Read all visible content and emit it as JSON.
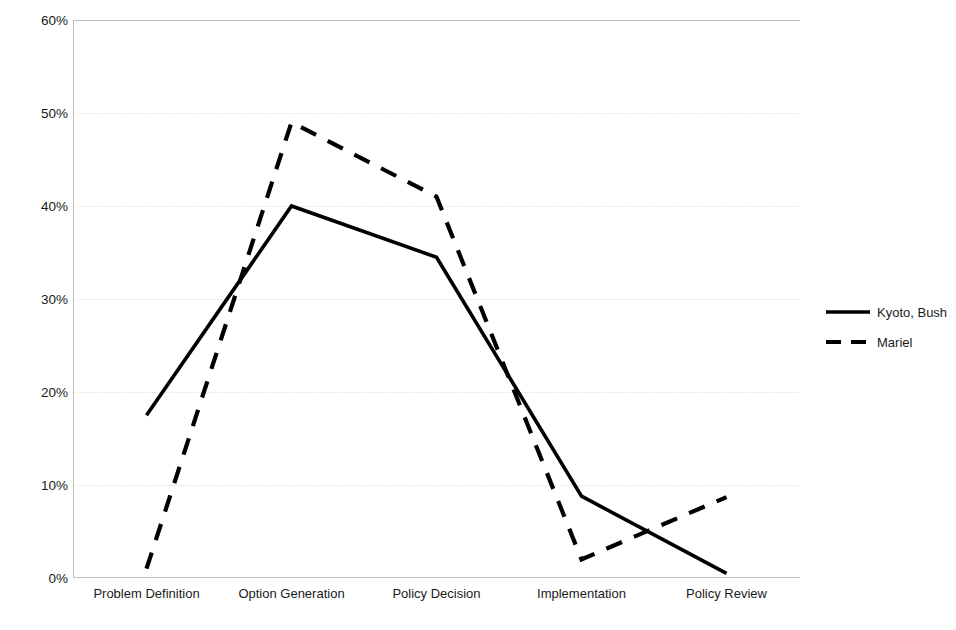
{
  "chart_data": {
    "type": "line",
    "title": "",
    "subtitle": "",
    "xlabel": "",
    "ylabel": "Television coverage per stage",
    "categories": [
      "Problem Definition",
      "Option Generation",
      "Policy Decision",
      "Implementation",
      "Policy Review"
    ],
    "ylim": [
      0,
      60
    ],
    "ytick_values": [
      0,
      10,
      20,
      30,
      40,
      50,
      60
    ],
    "ytick_labels": [
      "0%",
      "10%",
      "20%",
      "30%",
      "40%",
      "50%",
      "60%"
    ],
    "grid": true,
    "grid_axis": "y",
    "legend_position": "right",
    "series": [
      {
        "name": "Kyoto, Bush",
        "style": "solid",
        "color": "#000000",
        "values": [
          17.5,
          40.0,
          34.5,
          8.8,
          0.5
        ]
      },
      {
        "name": "Mariel",
        "style": "dashed",
        "color": "#000000",
        "values": [
          1.0,
          49.0,
          41.0,
          2.0,
          8.7
        ]
      }
    ]
  },
  "axes": {
    "y_title": "Television coverage per stage"
  },
  "legend": {
    "entries": [
      {
        "label": "Kyoto, Bush",
        "icon": "solid-line-swatch"
      },
      {
        "label": "Mariel",
        "icon": "dashed-line-swatch"
      }
    ]
  },
  "colors": {
    "series": "#000000",
    "grid": "#d9d9d3",
    "axis": "#bfbfb8",
    "background": "#ffffff",
    "text": "#1a1a1a"
  }
}
